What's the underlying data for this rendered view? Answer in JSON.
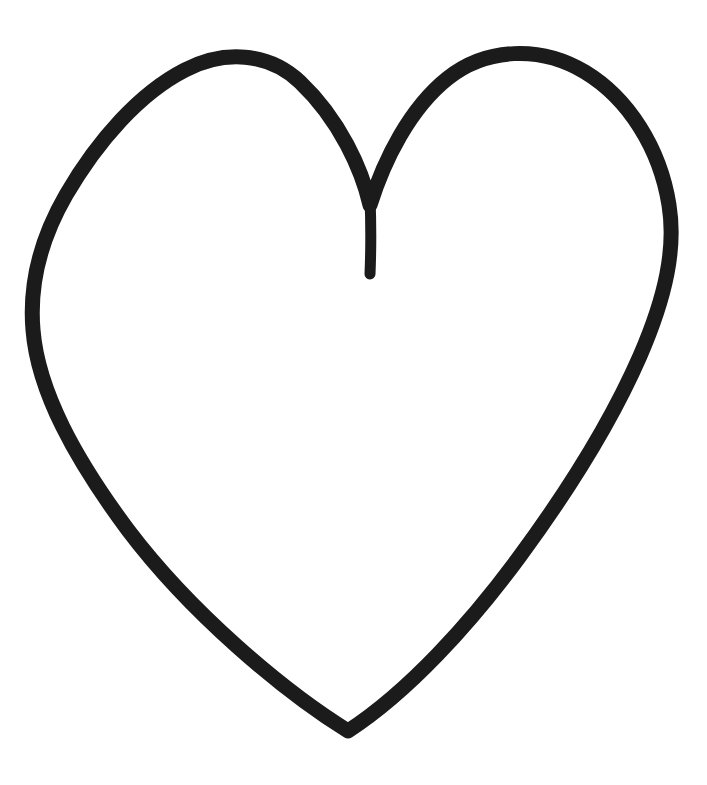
{
  "document": {
    "title": "Heart Outline Drawing",
    "canvas": {
      "width": 707,
      "height": 785,
      "background_color": "#ffffff"
    }
  },
  "artwork": {
    "name": "hand-drawn-heart-outline",
    "subject": "heart",
    "style": "hand-drawn marker outline",
    "filled": false,
    "stroke_color": "#1b1b1b",
    "stroke_width_px": 15,
    "cleft_stem_width_px": 11,
    "bounding_box": {
      "left": 30,
      "top": 45,
      "right": 672,
      "bottom": 736
    },
    "landmarks": {
      "left_lobe_top": [
        270,
        53
      ],
      "right_lobe_top": [
        530,
        47
      ],
      "leftmost_point": [
        30,
        272
      ],
      "rightmost_point": [
        670,
        250
      ],
      "cleft_apex": [
        370,
        200
      ],
      "cleft_stem_tip": [
        370,
        276
      ],
      "bottom_tip": [
        348,
        730
      ]
    },
    "outline_path": "M 370 205 C 362 170 340 120 300 82 C 268 52 224 50 185 70 C 140 93 98 140 66 195 C 40 240 29 283 33 330 C 38 392 76 460 128 530 C 190 612 282 690 348 731 C 408 692 470 624 520 556 C 570 488 612 420 640 356 C 666 296 676 248 669 205 C 660 148 628 98 585 72 C 540 45 486 48 448 78 C 410 108 384 160 370 205 Z",
    "cleft_stem_path": "M 370 198 C 371 222 371 250 370 274"
  }
}
